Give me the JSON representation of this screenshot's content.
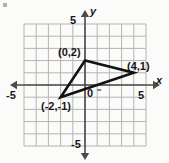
{
  "figure": {
    "background_color": "#fbfbfa",
    "grid_color": "#b4b4b4",
    "axis_color": "#4a4a4a",
    "shape_color": "#121212",
    "text_color": "#16161a"
  },
  "axis_labels": {
    "x": "x",
    "y": "y"
  },
  "ticks": {
    "x_left": "-5",
    "x_right": "5",
    "y_top": "5",
    "y_bottom": "-5",
    "origin": "0"
  },
  "vertex_labels": {
    "top": "(0,2)",
    "right": "(4,1)",
    "bottom_left": "(-2,-1)"
  },
  "chart_data": {
    "type": "scatter",
    "title": "",
    "xlabel": "x",
    "ylabel": "y",
    "xlim": [
      -5,
      5
    ],
    "ylim": [
      -5,
      5
    ],
    "xticks": [
      -5,
      5
    ],
    "yticks": [
      -5,
      5
    ],
    "grid": true,
    "grid_step": 1,
    "legend": "none",
    "shapes": [
      {
        "name": "triangle",
        "kind": "polygon",
        "closed": true,
        "filled": false,
        "stroke": "#121212",
        "points": [
          {
            "x": 0,
            "y": 2,
            "label": "(0,2)"
          },
          {
            "x": 4,
            "y": 1,
            "label": "(4,1)"
          },
          {
            "x": -2,
            "y": -1,
            "label": "(-2,-1)"
          }
        ]
      }
    ]
  }
}
